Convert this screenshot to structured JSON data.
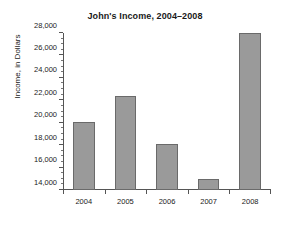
{
  "chart_data": {
    "type": "bar",
    "title": "John's Income, 2004–2008",
    "xlabel": "",
    "ylabel": "Income, in Dollars",
    "categories": [
      "2004",
      "2005",
      "2006",
      "2007",
      "2008"
    ],
    "values": [
      20100,
      22400,
      18100,
      15000,
      28000
    ],
    "ylim": [
      14000,
      28000
    ],
    "ytick_values": [
      14000,
      16000,
      18000,
      20000,
      22000,
      24000,
      26000,
      28000
    ],
    "ytick_labels": [
      "14,000",
      "16,000",
      "18,000",
      "20,000",
      "22,000",
      "24,000",
      "26,000",
      "28,000"
    ],
    "y_minor_tick_step": 500,
    "grid": false,
    "legend": null,
    "bar_color": "#9a9a9a",
    "bar_edge_color": "#6a6a6a",
    "axis_color": "#555555",
    "background_color": "#ffffff"
  }
}
